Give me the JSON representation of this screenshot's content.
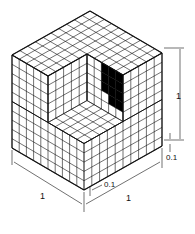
{
  "diagram": {
    "grid_divisions": 10,
    "colors": {
      "line": "#111111",
      "fill": "#ffffff",
      "shaded": "#000000"
    },
    "labels": {
      "left_edge": "1",
      "right_bottom_edge": "1",
      "right_height": "1",
      "cell_width": "0.1",
      "cell_height": "0.1"
    }
  }
}
